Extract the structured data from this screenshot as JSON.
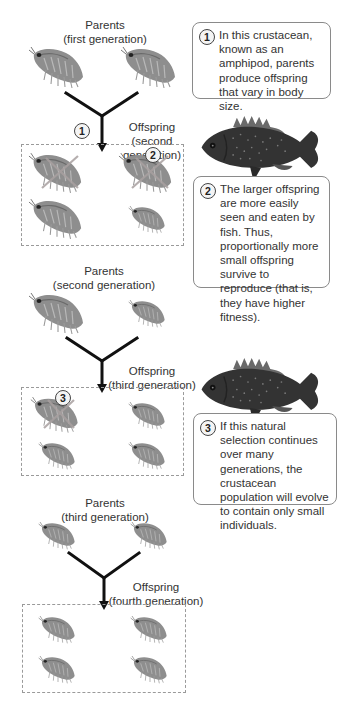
{
  "diagram": {
    "type": "natural-selection-in-amphipods",
    "generations": [
      {
        "parents_label": {
          "line1": "Parents",
          "line2": "(first generation)"
        },
        "offspring_label": {
          "line1": "Offspring",
          "line2": "(second generation)"
        },
        "step_marker": "1"
      },
      {
        "parents_label": {
          "line1": "Parents",
          "line2": "(second generation)"
        },
        "offspring_label": {
          "line1": "Offspring",
          "line2": "(third generation)"
        }
      },
      {
        "parents_label": {
          "line1": "Parents",
          "line2": "(third generation)"
        },
        "offspring_label": {
          "line1": "Offspring",
          "line2": "(fourth generation)"
        }
      }
    ],
    "offspring_marks": {
      "eaten_marker_2": "2",
      "eaten_marker_3": "3"
    },
    "callouts": [
      {
        "number": "1",
        "text": "In this crustacean, known as an amphipod, parents produce offspring that vary in body size."
      },
      {
        "number": "2",
        "text": "The larger offspring are more easily seen and eaten by fish. Thus, proportionally more small offspring survive to reproduce (that is, they have higher fitness)."
      },
      {
        "number": "3",
        "text": "If this natural selection continues over many generations, the crustacean population will evolve to contain only small individuals."
      }
    ],
    "icons": {
      "organism": "amphipod-icon",
      "predator": "fish-icon",
      "eliminated": "cross-out-icon"
    },
    "colors": {
      "lines": "#111111",
      "dash_border": "#9a9a9a",
      "callout_border": "#8a8a8a",
      "amphipod": "#8c8c8c",
      "fish": "#3a3a3a",
      "cross": "#b0a8a8"
    }
  }
}
